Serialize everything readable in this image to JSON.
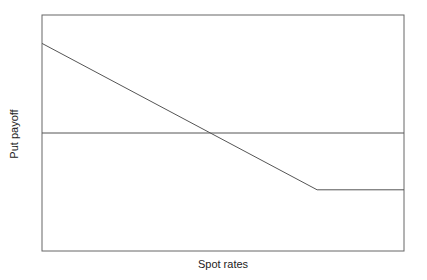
{
  "chart_data": {
    "type": "line",
    "title": "",
    "xlabel": "Spot rates",
    "ylabel": "Put payoff",
    "grid": false,
    "legend": null,
    "axis_ticks": "none",
    "series": [
      {
        "name": "Put payoff",
        "points": [
          {
            "x": 0.0,
            "y": 0.41
          },
          {
            "x": 0.76,
            "y": -0.26
          },
          {
            "x": 1.0,
            "y": -0.26
          }
        ]
      },
      {
        "name": "Zero line",
        "points": [
          {
            "x": 0.0,
            "y": 0.0
          },
          {
            "x": 1.0,
            "y": 0.0
          }
        ]
      }
    ],
    "xlim": [
      0,
      1
    ],
    "ylim": [
      -0.54,
      0.54
    ],
    "annotations": [
      "Payoff line crosses zero near x = 0.45",
      "Kink (strike) near x = 0.76"
    ]
  },
  "colors": {
    "axis": "#555555",
    "line": "#555555",
    "text": "#222222"
  }
}
